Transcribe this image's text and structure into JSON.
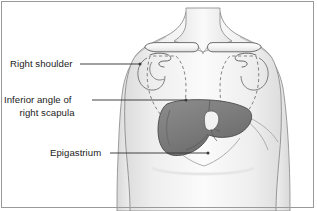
{
  "figure": {
    "border_color": "#9a9a9a",
    "background_color": "#ffffff"
  },
  "labels": [
    {
      "id": "right-shoulder",
      "text": "Right shoulder",
      "lines": [
        "Right shoulder"
      ],
      "leader_from": [
        80,
        64
      ],
      "leader_to": [
        140,
        64
      ],
      "dot": [
        140,
        64
      ]
    },
    {
      "id": "inferior-angle-right-scapula",
      "text": "Inferior angle of right scapula",
      "lines": [
        "Inferior angle of",
        "right scapula"
      ],
      "leader_from": [
        92,
        100
      ],
      "leader_to": [
        186,
        100
      ],
      "dot": [
        186,
        100
      ]
    },
    {
      "id": "epigastrium",
      "text": "Epigastrium",
      "lines": [
        "Epigastrium"
      ],
      "leader_from": [
        110,
        153
      ],
      "leader_to": [
        208,
        153
      ],
      "dot": [
        208,
        153
      ]
    }
  ],
  "anatomy": {
    "body_fill": "#f0f0f0",
    "body_stroke": "#8c8c8c",
    "skin_shadow": "#e2e2e2",
    "bone_fill": "#fafafa",
    "bone_stroke": "#6e6e6e",
    "scapula_dash_stroke": "#707070",
    "liver_fill": "#7e7e7e",
    "liver_dark": "#6b6b6b",
    "liver_stroke": "#4a4a4a",
    "gallbladder_fill": "#f2f2f2",
    "leader_stroke": "#3a3a3a",
    "parts": [
      {
        "name": "neck",
        "description": "anterior neck trapezoid"
      },
      {
        "name": "torso",
        "description": "upper chest and abdomen"
      },
      {
        "name": "right-arm",
        "description": "patient right arm (viewer left)"
      },
      {
        "name": "left-arm",
        "description": "patient left arm (viewer right)"
      },
      {
        "name": "right-clavicle",
        "description": "rounded bar clavicle, viewer left"
      },
      {
        "name": "left-clavicle",
        "description": "rounded bar clavicle, viewer right"
      },
      {
        "name": "right-scapula",
        "description": "dashed triangular scapula outline, viewer left"
      },
      {
        "name": "left-scapula",
        "description": "dashed triangular scapula outline, viewer right"
      },
      {
        "name": "right-shoulder-joint",
        "description": "humeral head and acromion, viewer left"
      },
      {
        "name": "left-shoulder-joint",
        "description": "humeral head and acromion, viewer right"
      },
      {
        "name": "liver",
        "description": "shaded liver spanning upper abdomen"
      },
      {
        "name": "gallbladder",
        "description": "pale notch at liver inferior border"
      },
      {
        "name": "costal-margin",
        "description": "rib margin lines below liver"
      }
    ]
  }
}
